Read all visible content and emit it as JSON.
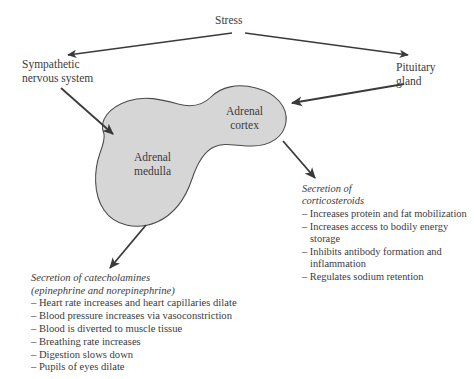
{
  "diagram": {
    "colors": {
      "gland_fill": "#d6d6d6",
      "gland_stroke": "#4a4a4a",
      "arrow": "#3a3a3a",
      "text": "#3b3b3d",
      "background": "#ffffff"
    },
    "nodes": {
      "stress": "Stress",
      "sympathetic": "Sympathetic\nnervous system",
      "pituitary": "Pituitary\ngland",
      "adrenal_cortex": "Adrenal\ncortex",
      "adrenal_medulla": "Adrenal\nmedulla"
    },
    "outcomes": {
      "corticosteroids": {
        "heading": "Secretion of\ncorticosteroids",
        "items": [
          "– Increases protein and fat mobilization",
          "– Increases access to bodily energy storage",
          "– Inhibits antibody formation and inflammation",
          "– Regulates sodium retention"
        ]
      },
      "catecholamines": {
        "heading": "Secretion of catecholamines\n(epinephrine and norepinephrine)",
        "items": [
          "– Heart rate increases and heart capillaries dilate",
          "– Blood pressure increases via vasoconstriction",
          "– Blood is diverted to muscle tissue",
          "– Breathing rate increases",
          "– Digestion slows down",
          "– Pupils of eyes dilate"
        ]
      }
    },
    "arrows": [
      {
        "name": "stress-to-sympathetic",
        "from": "Stress",
        "to": "Sympathetic nervous system"
      },
      {
        "name": "stress-to-pituitary",
        "from": "Stress",
        "to": "Pituitary gland"
      },
      {
        "name": "sympathetic-to-medulla",
        "from": "Sympathetic nervous system",
        "to": "Adrenal medulla"
      },
      {
        "name": "pituitary-to-cortex",
        "from": "Pituitary gland",
        "to": "Adrenal cortex"
      },
      {
        "name": "cortex-to-corticosteroids",
        "from": "Adrenal cortex",
        "to": "Secretion of corticosteroids"
      },
      {
        "name": "medulla-to-catecholamines",
        "from": "Adrenal medulla",
        "to": "Secretion of catecholamines"
      }
    ]
  }
}
